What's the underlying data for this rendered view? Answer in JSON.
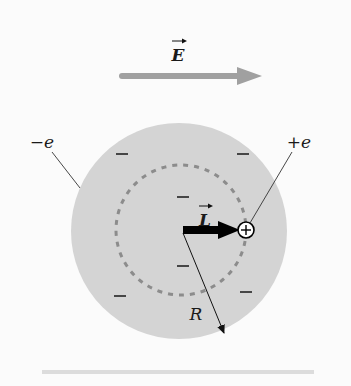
{
  "diagram": {
    "field": {
      "label": "E",
      "vector": true,
      "color": "#a0a0a0"
    },
    "sphere": {
      "fill": "#d4d4d4",
      "charge_label": "−e",
      "radius_label": "R"
    },
    "orbit": {
      "style": "dashed",
      "color": "#8c8c8c"
    },
    "nucleus": {
      "charge_label": "+e",
      "symbol": "+"
    },
    "displacement": {
      "label": "L",
      "vector": true,
      "color": "#000000"
    },
    "minus_signs": [
      {
        "x": 122,
        "y": 154,
        "symbol": "−"
      },
      {
        "x": 243,
        "y": 154,
        "symbol": "−"
      },
      {
        "x": 183,
        "y": 197,
        "symbol": "−"
      },
      {
        "x": 183,
        "y": 266,
        "symbol": "−"
      },
      {
        "x": 120,
        "y": 296,
        "symbol": "−"
      },
      {
        "x": 246,
        "y": 292,
        "symbol": "−"
      }
    ],
    "baseline_color": "#dcdcdc"
  }
}
